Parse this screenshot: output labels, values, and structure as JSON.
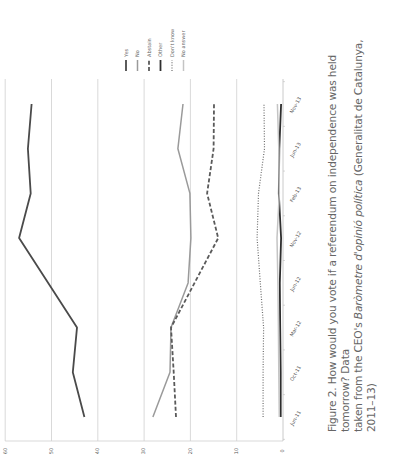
{
  "chart_data": {
    "type": "line",
    "orientation": "rotated 90 degrees counter-clockwise (value axis runs horizontally along bottom, categories run vertically)",
    "title": "",
    "xlabel": "",
    "ylabel": "",
    "categories": [
      "Jun-11",
      "Oct-11",
      "Mar-12",
      "Jun-12",
      "Nov-12",
      "Feb-13",
      "Jun-13",
      "Nov-13"
    ],
    "ylim": [
      0,
      60
    ],
    "yticks": [
      0,
      10,
      20,
      30,
      40,
      50,
      60
    ],
    "grid": true,
    "legend_position": "top-right (rotated)",
    "series": [
      {
        "name": "Yes",
        "style": "solid-thick",
        "color": "#4a4a4a",
        "values": [
          42.9,
          45.4,
          44.5,
          null,
          57.0,
          54.5,
          55.1,
          54.3
        ]
      },
      {
        "name": "No",
        "style": "solid",
        "color": "#9a9a9a",
        "values": [
          28.1,
          24.4,
          24.2,
          20.5,
          19.9,
          20.1,
          22.7,
          21.6
        ]
      },
      {
        "name": "Abstain",
        "style": "dashed",
        "color": "#5a5a5a",
        "values": [
          23.1,
          23.6,
          24.2,
          null,
          14.0,
          16.4,
          15.0,
          14.9
        ]
      },
      {
        "name": "Other",
        "style": "solid-thick",
        "color": "#2e2e2e",
        "values": [
          0.5,
          0.5,
          0.6,
          0.7,
          0.4,
          0.9,
          0.8,
          0.4
        ]
      },
      {
        "name": "Don't know",
        "style": "dotted",
        "color": "#6e6e6e",
        "values": [
          4.3,
          4.3,
          4.2,
          4.9,
          5.6,
          5.3,
          4.0,
          4.1
        ]
      },
      {
        "name": "No answer",
        "style": "solid",
        "color": "#c4c4c4",
        "values": [
          0.8,
          0.9,
          1.0,
          1.1,
          1.3,
          0.8,
          0.9,
          1.2
        ]
      }
    ]
  },
  "caption": {
    "line1_prefix": "Figure 2. How would you vote if a referendum on independence was held tomorrow? Data",
    "line2_prefix": "taken from the CEO's ",
    "line2_italic": "Baròmetre d'opinió política",
    "line2_suffix": " (Generalitat de Catalunya, 2011–13)"
  }
}
